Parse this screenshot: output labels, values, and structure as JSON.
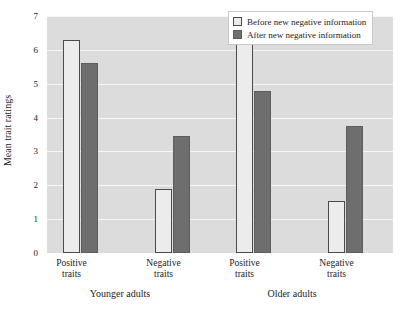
{
  "figure": {
    "cropped_title_fragment": "",
    "background_color": "#ffffff",
    "plot_background_color": "#dcdcdc",
    "gridline_color": "#f6f6f6"
  },
  "legend": {
    "position": "top-right",
    "entries": [
      {
        "label": "Before new negative information",
        "color": "#ececec",
        "swatch": "before-swatch"
      },
      {
        "label": "After new negative information",
        "color": "#6e6e6e",
        "swatch": "after-swatch"
      }
    ]
  },
  "axes": {
    "ylabel": "Mean trait ratings",
    "yticks": [
      "0",
      "1",
      "2",
      "3",
      "4",
      "5",
      "6",
      "7"
    ],
    "group_labels": [
      "Younger adults",
      "Older adults"
    ],
    "category_labels": [
      {
        "line1": "Positive",
        "line2": "traits"
      },
      {
        "line1": "Negative",
        "line2": "traits"
      },
      {
        "line1": "Positive",
        "line2": "traits"
      },
      {
        "line1": "Negative",
        "line2": "traits"
      }
    ]
  },
  "chart_data": {
    "type": "bar",
    "title": "",
    "xlabel": "",
    "ylabel": "Mean trait ratings",
    "ylim": [
      0,
      7
    ],
    "yticks": [
      0,
      1,
      2,
      3,
      4,
      5,
      6,
      7
    ],
    "grid": true,
    "legend_position": "top-right",
    "groups": [
      "Younger adults",
      "Older adults"
    ],
    "categories": [
      "Younger adults / Positive traits",
      "Younger adults / Negative traits",
      "Older adults / Positive traits",
      "Older adults / Negative traits"
    ],
    "series": [
      {
        "name": "Before new negative information",
        "color": "#ececec",
        "values": [
          6.3,
          1.9,
          6.2,
          1.55
        ]
      },
      {
        "name": "After new negative information",
        "color": "#6e6e6e",
        "values": [
          5.6,
          3.45,
          4.8,
          3.75
        ]
      }
    ]
  }
}
